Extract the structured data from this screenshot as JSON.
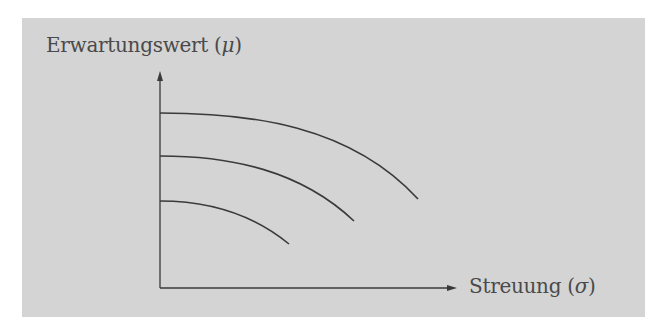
{
  "diagram": {
    "y_axis_label": "Erwartungswert",
    "y_axis_symbol": "μ",
    "x_axis_label": "Streuung",
    "x_axis_symbol": "σ",
    "curve_count": 3,
    "colors": {
      "background_panel": "#d4d4d4",
      "line": "#3a3a3a",
      "text": "#4a4a4a"
    }
  }
}
